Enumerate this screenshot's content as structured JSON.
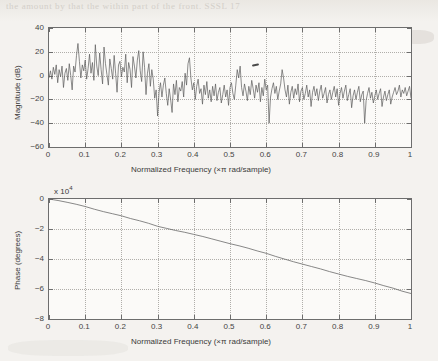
{
  "page": {
    "background_color": "#f4f2ef",
    "ghost_text": "the amount by that the within part of the front. SSSL 17",
    "artifact_note": "scan-speck"
  },
  "chart_data": [
    {
      "type": "line",
      "name": "magnitude-response",
      "title": "",
      "xlabel": "Normalized Frequency  (×π rad/sample)",
      "ylabel": "Magnitude (dB)",
      "xlim": [
        0,
        1
      ],
      "ylim": [
        -60,
        40
      ],
      "xticks": [
        "0",
        "0.1",
        "0.2",
        "0.3",
        "0.4",
        "0.5",
        "0.6",
        "0.7",
        "0.8",
        "0.9",
        "1"
      ],
      "xtick_values": [
        0,
        0.1,
        0.2,
        0.3,
        0.4,
        0.5,
        0.6,
        0.7,
        0.8,
        0.9,
        1
      ],
      "yticks": [
        "40",
        "20",
        "0",
        "-20",
        "-40",
        "-60"
      ],
      "ytick_values": [
        40,
        20,
        0,
        -20,
        -40,
        -60
      ],
      "grid": true,
      "legend": "none",
      "series": [
        {
          "name": "Magnitude (dB)",
          "color": "#5a5a5a",
          "x": [
            0,
            0.004,
            0.008,
            0.012,
            0.016,
            0.02,
            0.024,
            0.028,
            0.032,
            0.036,
            0.04,
            0.044,
            0.048,
            0.052,
            0.056,
            0.06,
            0.064,
            0.068,
            0.072,
            0.076,
            0.08,
            0.084,
            0.088,
            0.092,
            0.096,
            0.1,
            0.104,
            0.108,
            0.112,
            0.116,
            0.12,
            0.124,
            0.128,
            0.132,
            0.136,
            0.14,
            0.144,
            0.148,
            0.152,
            0.156,
            0.16,
            0.164,
            0.168,
            0.172,
            0.176,
            0.18,
            0.184,
            0.188,
            0.192,
            0.196,
            0.2,
            0.204,
            0.208,
            0.212,
            0.216,
            0.22,
            0.224,
            0.228,
            0.232,
            0.236,
            0.24,
            0.244,
            0.248,
            0.252,
            0.256,
            0.26,
            0.264,
            0.268,
            0.272,
            0.276,
            0.28,
            0.284,
            0.288,
            0.292,
            0.296,
            0.3,
            0.304,
            0.308,
            0.312,
            0.316,
            0.32,
            0.324,
            0.328,
            0.332,
            0.336,
            0.34,
            0.344,
            0.348,
            0.352,
            0.356,
            0.36,
            0.364,
            0.368,
            0.372,
            0.376,
            0.38,
            0.384,
            0.388,
            0.392,
            0.396,
            0.4,
            0.404,
            0.408,
            0.412,
            0.416,
            0.42,
            0.424,
            0.428,
            0.432,
            0.436,
            0.44,
            0.444,
            0.448,
            0.452,
            0.456,
            0.46,
            0.464,
            0.468,
            0.472,
            0.476,
            0.48,
            0.484,
            0.488,
            0.492,
            0.496,
            0.5,
            0.504,
            0.508,
            0.512,
            0.516,
            0.52,
            0.524,
            0.528,
            0.532,
            0.536,
            0.54,
            0.544,
            0.548,
            0.552,
            0.556,
            0.56,
            0.564,
            0.568,
            0.572,
            0.576,
            0.58,
            0.584,
            0.588,
            0.592,
            0.596,
            0.6,
            0.604,
            0.608,
            0.612,
            0.616,
            0.62,
            0.624,
            0.628,
            0.632,
            0.636,
            0.64,
            0.644,
            0.648,
            0.652,
            0.656,
            0.66,
            0.664,
            0.668,
            0.672,
            0.676,
            0.68,
            0.684,
            0.688,
            0.692,
            0.696,
            0.7,
            0.704,
            0.708,
            0.712,
            0.716,
            0.72,
            0.724,
            0.728,
            0.732,
            0.736,
            0.74,
            0.744,
            0.748,
            0.752,
            0.756,
            0.76,
            0.764,
            0.768,
            0.772,
            0.776,
            0.78,
            0.784,
            0.788,
            0.792,
            0.796,
            0.8,
            0.804,
            0.808,
            0.812,
            0.816,
            0.82,
            0.824,
            0.828,
            0.832,
            0.836,
            0.84,
            0.844,
            0.848,
            0.852,
            0.856,
            0.86,
            0.864,
            0.868,
            0.872,
            0.876,
            0.88,
            0.884,
            0.888,
            0.892,
            0.896,
            0.9,
            0.904,
            0.908,
            0.912,
            0.916,
            0.92,
            0.924,
            0.928,
            0.932,
            0.936,
            0.94,
            0.944,
            0.948,
            0.952,
            0.956,
            0.96,
            0.964,
            0.968,
            0.972,
            0.976,
            0.98,
            0.984,
            0.988,
            0.992,
            0.996,
            1
          ],
          "y": [
            -2,
            4,
            -3,
            7,
            1,
            9,
            -6,
            5,
            -1,
            8,
            -10,
            2,
            6,
            -4,
            10,
            0,
            -12,
            8,
            3,
            17,
            27,
            12,
            -2,
            9,
            4,
            13,
            -3,
            6,
            18,
            2,
            11,
            -4,
            26,
            8,
            0,
            19,
            5,
            -7,
            24,
            10,
            1,
            -8,
            14,
            6,
            -3,
            17,
            2,
            -14,
            9,
            12,
            -1,
            7,
            3,
            18,
            -6,
            11,
            5,
            -10,
            16,
            8,
            -2,
            13,
            21,
            4,
            -5,
            20,
            7,
            -16,
            2,
            10,
            -9,
            5,
            -3,
            -19,
            -12,
            -34,
            -14,
            -6,
            -18,
            -8,
            -2,
            -15,
            -25,
            -11,
            -20,
            -31,
            -7,
            -16,
            -4,
            -22,
            -10,
            -13,
            -5,
            -18,
            2,
            -8,
            10,
            15,
            -2,
            -12,
            -6,
            -20,
            -9,
            -3,
            -15,
            -11,
            -24,
            -8,
            -16,
            -5,
            -19,
            -12,
            -22,
            -9,
            -17,
            -7,
            -21,
            -14,
            -10,
            -23,
            -16,
            -8,
            -18,
            -12,
            -25,
            -10,
            -6,
            -15,
            -20,
            -8,
            5,
            -2,
            8,
            -10,
            -17,
            -7,
            -13,
            -21,
            -9,
            -16,
            -4,
            -11,
            -19,
            -8,
            -14,
            -6,
            -22,
            -10,
            -17,
            -3,
            -12,
            -8,
            -40,
            -18,
            -11,
            -6,
            -15,
            -9,
            -20,
            -13,
            -7,
            5,
            -2,
            -12,
            -18,
            -8,
            -24,
            -14,
            -9,
            -19,
            -11,
            -16,
            -7,
            -22,
            -13,
            -10,
            -20,
            -15,
            -8,
            -18,
            -12,
            -26,
            -14,
            -9,
            -17,
            -11,
            -21,
            -13,
            -8,
            -19,
            -15,
            -10,
            -23,
            -16,
            -12,
            -20,
            -14,
            -9,
            -18,
            -11,
            -25,
            -15,
            -10,
            -19,
            -13,
            -8,
            -21,
            -16,
            -11,
            -27,
            -17,
            -12,
            -20,
            -14,
            -9,
            -22,
            -16,
            -13,
            -40,
            -21,
            -15,
            -10,
            -19,
            -14,
            -23,
            -17,
            -12,
            -20,
            -15,
            -11,
            -26,
            -18,
            -13,
            -21,
            -16,
            -12,
            -24,
            -18,
            -14,
            -10,
            -16,
            -13,
            -8,
            -18,
            -12,
            -15,
            -10,
            -17,
            -13,
            -9,
            -19,
            -14,
            -11,
            -22,
            -16,
            -12,
            -18,
            -14,
            -20,
            -15,
            -11,
            -24,
            -17,
            -13,
            -19,
            -15,
            -22
          ]
        }
      ]
    },
    {
      "type": "line",
      "name": "phase-response",
      "title": "",
      "xlabel": "Normalized Frequency  (×π rad/sample)",
      "ylabel": "Phase (degrees)",
      "y_exponent_label": "x 10",
      "y_exponent_power": "4",
      "xlim": [
        0,
        1
      ],
      "ylim": [
        -8,
        0
      ],
      "xticks": [
        "0",
        "0.1",
        "0.2",
        "0.3",
        "0.4",
        "0.5",
        "0.6",
        "0.7",
        "0.8",
        "0.9",
        "1"
      ],
      "xtick_values": [
        0,
        0.1,
        0.2,
        0.3,
        0.4,
        0.5,
        0.6,
        0.7,
        0.8,
        0.9,
        1
      ],
      "yticks": [
        "0",
        "-2",
        "-4",
        "-6",
        "-8"
      ],
      "ytick_values": [
        0,
        -2,
        -4,
        -6,
        -8
      ],
      "grid": true,
      "legend": "none",
      "series": [
        {
          "name": "Phase (degrees)",
          "color": "#6a6a6a",
          "units": "x 10^4 degrees",
          "x": [
            0,
            0.025,
            0.05,
            0.075,
            0.1,
            0.125,
            0.15,
            0.175,
            0.2,
            0.225,
            0.25,
            0.275,
            0.3,
            0.325,
            0.35,
            0.375,
            0.4,
            0.425,
            0.45,
            0.475,
            0.5,
            0.525,
            0.55,
            0.575,
            0.6,
            0.625,
            0.65,
            0.675,
            0.7,
            0.725,
            0.75,
            0.775,
            0.8,
            0.825,
            0.85,
            0.875,
            0.9,
            0.925,
            0.95,
            0.975,
            1
          ],
          "y": [
            0,
            -0.1,
            -0.22,
            -0.35,
            -0.5,
            -0.68,
            -0.84,
            -0.98,
            -1.12,
            -1.3,
            -1.45,
            -1.62,
            -1.82,
            -1.96,
            -2.1,
            -2.22,
            -2.36,
            -2.5,
            -2.66,
            -2.82,
            -2.98,
            -3.12,
            -3.28,
            -3.46,
            -3.62,
            -3.82,
            -4.0,
            -4.18,
            -4.34,
            -4.5,
            -4.66,
            -4.84,
            -5.0,
            -5.16,
            -5.3,
            -5.44,
            -5.6,
            -5.78,
            -5.94,
            -6.14,
            -6.3
          ]
        }
      ]
    }
  ]
}
